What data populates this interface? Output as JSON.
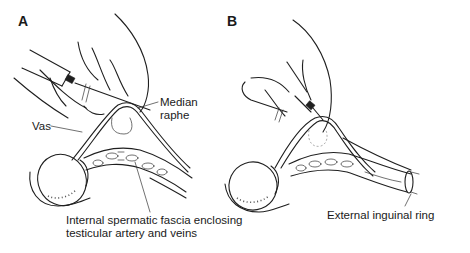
{
  "figure": {
    "panels": [
      {
        "id": "A",
        "letter": "A",
        "labels": {
          "median_raphe_line1": "Median",
          "median_raphe_line2": "raphe",
          "vas": "Vas",
          "fascia_line1": "Internal spermatic fascia enclosing",
          "fascia_line2": "testicular artery and veins"
        }
      },
      {
        "id": "B",
        "letter": "B",
        "labels": {
          "external_ring": "External inguinal ring"
        }
      }
    ],
    "colors": {
      "background": "#ffffff",
      "ink": "#1f1f1f"
    }
  }
}
